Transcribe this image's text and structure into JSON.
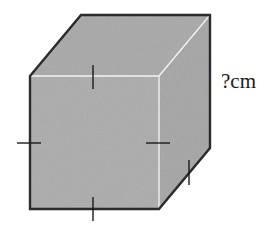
{
  "diagram": {
    "type": "cube",
    "edge_label": "?cm",
    "colors": {
      "face": "#a9a9a9",
      "outline": "#2b2b2b",
      "inner_edge": "#f2f2f2",
      "tick": "#1a1a1a",
      "background": "#ffffff"
    },
    "tick_marks": [
      {
        "edge": "front-top",
        "orientation": "vertical"
      },
      {
        "edge": "front-left",
        "orientation": "horizontal"
      },
      {
        "edge": "front-right",
        "orientation": "horizontal"
      },
      {
        "edge": "front-bottom",
        "orientation": "vertical"
      },
      {
        "edge": "bottom-right-depth",
        "orientation": "vertical"
      }
    ]
  }
}
